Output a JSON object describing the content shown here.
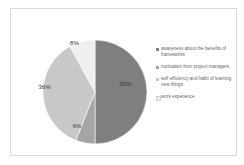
{
  "chart_data": {
    "type": "pie",
    "title": "",
    "start_angle_deg": 0,
    "direction": "clockwise",
    "categories": [
      "awareness about the benefits of frameworks",
      "motivation from project managers",
      "self efficiency and habit of learning new things",
      "work experience"
    ],
    "values": [
      50,
      6,
      36,
      8
    ],
    "labels": [
      "50%",
      "6%",
      "36%",
      "8%"
    ],
    "colors": [
      "#7f7f7f",
      "#a5a5a5",
      "#c8c8c8",
      "#efefef"
    ],
    "legend_position": "right"
  },
  "legend": {
    "items": [
      {
        "label": "awareness about the benefits of frameworks",
        "color": "#7f7f7f"
      },
      {
        "label": "motivation from project managers",
        "color": "#a5a5a5"
      },
      {
        "label": "self efficiency and habit of learning new things",
        "color": "#c8c8c8"
      },
      {
        "label": "work experience",
        "color": "#efefef"
      }
    ]
  }
}
